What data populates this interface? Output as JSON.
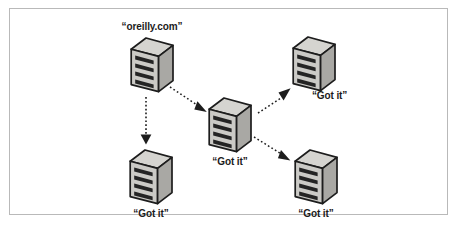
{
  "figure": {
    "type": "network-propagation-diagram",
    "title": "",
    "border_color": "#b9b9b9",
    "background": "#ffffff"
  },
  "palette": {
    "server_top_face": "#d5d4d0",
    "server_front_face": "#c9c8c4",
    "server_side_face": "#a9a8a4",
    "server_outline": "#1d1d1d",
    "slot_dark": "#242424",
    "arrow_color": "#1d1d1d",
    "label_color": "#1b1b1b"
  },
  "nodes": [
    {
      "id": "origin-server",
      "label": "“oreilly.com”",
      "label_position": "above",
      "x": 129,
      "y": 36,
      "width": 46,
      "height": 58
    },
    {
      "id": "center-server",
      "label": "“Got it”",
      "label_position": "below",
      "x": 207,
      "y": 96,
      "width": 46,
      "height": 58
    },
    {
      "id": "bottom-left-server",
      "label": "“Got it”",
      "label_position": "below",
      "x": 128,
      "y": 148,
      "width": 46,
      "height": 58
    },
    {
      "id": "top-right-server",
      "label": "“Got it”",
      "label_position": "below-right",
      "x": 291,
      "y": 35,
      "width": 46,
      "height": 58
    },
    {
      "id": "bottom-right-server",
      "label": "“Got it”",
      "label_position": "below",
      "x": 293,
      "y": 148,
      "width": 46,
      "height": 58
    }
  ],
  "arrows": [
    {
      "id": "origin-to-bottom-left",
      "from": "origin-server",
      "to": "bottom-left-server",
      "style": "dotted",
      "direction": "down",
      "x1": 146,
      "y1": 97,
      "x2": 146,
      "y2": 143
    },
    {
      "id": "origin-to-center",
      "from": "origin-server",
      "to": "center-server",
      "style": "dotted",
      "direction": "down-right",
      "x1": 171,
      "y1": 88,
      "x2": 204,
      "y2": 110
    },
    {
      "id": "center-to-top-right",
      "from": "center-server",
      "to": "top-right-server",
      "style": "dotted",
      "direction": "up-right",
      "x1": 256,
      "y1": 112,
      "x2": 290,
      "y2": 89
    },
    {
      "id": "center-to-bottom-right",
      "from": "center-server",
      "to": "bottom-right-server",
      "style": "dotted",
      "direction": "down-right",
      "x1": 254,
      "y1": 137,
      "x2": 288,
      "y2": 159
    }
  ]
}
